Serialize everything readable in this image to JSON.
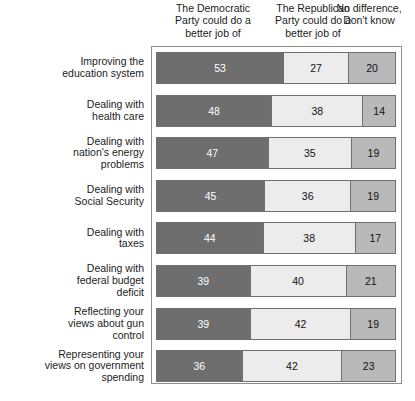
{
  "chart_data": {
    "type": "bar",
    "orientation": "horizontal",
    "stacked": true,
    "normalized_percent": true,
    "title": "",
    "subtitle": "",
    "xlabel": "",
    "ylabel": "",
    "xlim": [
      0,
      100
    ],
    "grid": false,
    "legend_position": "top",
    "value_suffix": "",
    "categories": [
      "Improving the\neducation system",
      "Dealing with\nhealth care",
      "Dealing with\nnation's energy\nproblems",
      "Dealing with\nSocial Security",
      "Dealing with\ntaxes",
      "Dealing with\nfederal budget\ndeficit",
      "Reflecting your\nviews about gun\ncontrol",
      "Representing your\nviews on government\nspending"
    ],
    "series": [
      {
        "name": "The Democratic\nParty could do a\nbetter job of",
        "color": "#6e6e6e",
        "label_color": "#ffffff",
        "values": [
          53,
          48,
          47,
          45,
          44,
          39,
          39,
          36
        ]
      },
      {
        "name": "The Republican\nParty could do a\nbetter job of",
        "color": "#ececed",
        "label_color": "#111111",
        "values": [
          27,
          38,
          35,
          36,
          38,
          40,
          42,
          42
        ]
      },
      {
        "name": "No difference,\nDon't know",
        "color": "#b9b9b9",
        "label_color": "#111111",
        "values": [
          20,
          14,
          19,
          19,
          17,
          21,
          19,
          23
        ]
      }
    ],
    "rows": [
      {
        "label": "Improving the\neducation system",
        "democratic": 53,
        "republican": 27,
        "no_difference": 20
      },
      {
        "label": "Dealing with\nhealth care",
        "democratic": 48,
        "republican": 38,
        "no_difference": 14
      },
      {
        "label": "Dealing with\nnation's energy\nproblems",
        "democratic": 47,
        "republican": 35,
        "no_difference": 19
      },
      {
        "label": "Dealing with\nSocial Security",
        "democratic": 45,
        "republican": 36,
        "no_difference": 19
      },
      {
        "label": "Dealing with\ntaxes",
        "democratic": 44,
        "republican": 38,
        "no_difference": 17
      },
      {
        "label": "Dealing with\nfederal budget\ndeficit",
        "democratic": 39,
        "republican": 40,
        "no_difference": 21
      },
      {
        "label": "Reflecting your\nviews about gun\ncontrol",
        "democratic": 39,
        "republican": 42,
        "no_difference": 19
      },
      {
        "label": "Representing your\nviews on government\nspending",
        "democratic": 36,
        "republican": 42,
        "no_difference": 23
      }
    ]
  },
  "headers": {
    "col1": "The Democratic\nParty could do a\nbetter job of",
    "col2": "The Republican\nParty could do a\nbetter job of",
    "col3": "No difference,\nDon't know"
  }
}
